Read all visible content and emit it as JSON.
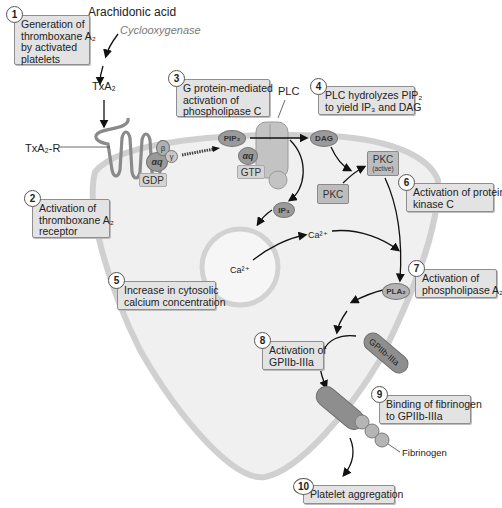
{
  "diagram": {
    "colors": {
      "box_fill": "#e3e3e3",
      "box_border": "#8f8f8f",
      "cell_fill": "#efefef",
      "membrane": "#d4d4d4",
      "molecule": "#9a9a9a",
      "arrow": "#111111"
    },
    "labels": {
      "arachidonic_acid": "Arachidonic acid",
      "cyclooxygenase": "Cyclooxygenase",
      "txa2": "TxA₂",
      "txa2_r": "TxA₂-R",
      "plc": "PLC",
      "pip2": "PIP₂",
      "dag": "DAG",
      "alpha_q_gdp": "αq",
      "beta": "β",
      "gamma": "γ",
      "gdp": "GDP",
      "alpha_q_gtp": "αq",
      "gtp": "GTP",
      "pkc": "PKC",
      "pkc_active": "PKC",
      "pkc_active_sub": "(active)",
      "ip3": "IP₃",
      "ca_store": "Ca²⁺",
      "ca_cytosol": "Ca²⁺",
      "pla2": "PLA₂",
      "gpiib_iiia": "GPIIb-IIIa",
      "fibrinogen": "Fibrinogen"
    },
    "steps": [
      {
        "num": "1",
        "text": [
          "Generation of",
          "thromboxane A₂",
          "by activated",
          "platelets"
        ]
      },
      {
        "num": "2",
        "text": [
          "Activation of",
          "thromboxane A₂",
          "receptor"
        ]
      },
      {
        "num": "3",
        "text": [
          "G protein-mediated",
          "activation of",
          "phospholipase C"
        ]
      },
      {
        "num": "4",
        "text": [
          "PLC hydrolyzes PIP₂",
          "to yield IP₃ and DAG"
        ]
      },
      {
        "num": "5",
        "text": [
          "Increase in cytosolic",
          "calcium concentration"
        ]
      },
      {
        "num": "6",
        "text": [
          "Activation of protein",
          "kinase C"
        ]
      },
      {
        "num": "7",
        "text": [
          "Activation of",
          "phospholipase A₂"
        ]
      },
      {
        "num": "8",
        "text": [
          "Activation of",
          "GPIIb-IIIa"
        ]
      },
      {
        "num": "9",
        "text": [
          "Binding of fibrinogen",
          "to GPIIb-IIIa"
        ]
      },
      {
        "num": "10",
        "text": [
          "Platelet aggregation"
        ]
      }
    ]
  }
}
